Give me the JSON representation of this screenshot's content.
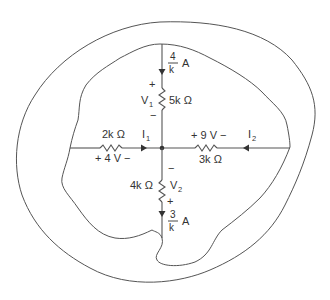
{
  "diagram": {
    "type": "circuit-node-with-surfaces",
    "colors": {
      "line": "#555555",
      "text": "#333333",
      "background": "#ffffff"
    },
    "top_branch": {
      "current_numerator": "4",
      "current_denominator": "k",
      "current_unit": "A",
      "resistor": "5k Ω",
      "voltage_name": "V",
      "voltage_sub": "1",
      "plus": "+",
      "minus": "−"
    },
    "left_branch": {
      "resistor": "2k Ω",
      "current_name": "I",
      "current_sub": "1",
      "voltage": "+ 4 V −"
    },
    "right_branch": {
      "resistor": "3k Ω",
      "current_name": "I",
      "current_sub": "2",
      "voltage": "+ 9 V −"
    },
    "bottom_branch": {
      "resistor": "4k Ω",
      "voltage_name": "V",
      "voltage_sub": "2",
      "plus": "+",
      "minus": "−",
      "current_numerator": "3",
      "current_denominator": "k",
      "current_unit": "A"
    }
  }
}
